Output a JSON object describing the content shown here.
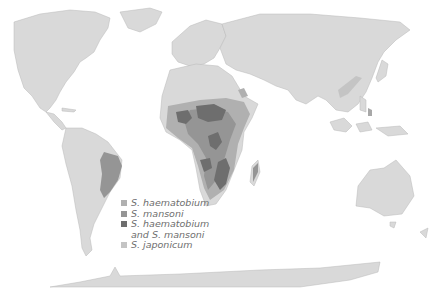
{
  "map": {
    "subject": "Global distribution of schistosomiasis",
    "colors": {
      "ocean": "#ffffff",
      "land": "#d9d9d9",
      "haematobium": "#b0b0b0",
      "mansoni": "#959595",
      "both": "#6e6e6e",
      "japonicum": "#c4c4c4"
    }
  },
  "legend": {
    "items": [
      {
        "key": "haematobium",
        "label": "S. haematobium",
        "color": "#b0b0b0"
      },
      {
        "key": "mansoni",
        "label": "S. mansoni",
        "color": "#959595"
      },
      {
        "key": "both",
        "label": "S. haematobium\nand S. mansoni",
        "color": "#6e6e6e"
      },
      {
        "key": "japonicum",
        "label": "S. japonicum",
        "color": "#c4c4c4"
      }
    ]
  }
}
